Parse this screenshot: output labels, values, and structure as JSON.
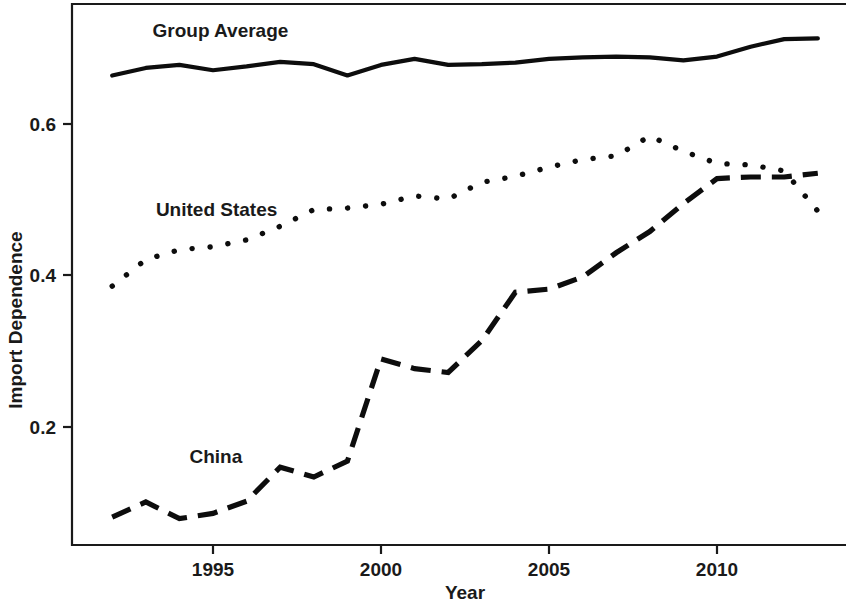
{
  "chart_data": {
    "type": "line",
    "title": "",
    "xlabel": "Year",
    "ylabel": "Import Dependence",
    "xlim": [
      1992,
      2013
    ],
    "ylim": [
      0.06,
      0.745
    ],
    "grid": false,
    "legend": "inline-labels",
    "x_ticks": [
      1995,
      2000,
      2005,
      2010
    ],
    "x_tick_labels": [
      "1995",
      "2000",
      "2005",
      "2010"
    ],
    "y_ticks": [
      0.2,
      0.4,
      0.6
    ],
    "y_tick_labels": [
      "0.2",
      "0.4",
      "0.6"
    ],
    "x": [
      1992,
      1993,
      1994,
      1995,
      1996,
      1997,
      1998,
      1999,
      2000,
      2001,
      2002,
      2003,
      2004,
      2005,
      2006,
      2007,
      2008,
      2009,
      2010,
      2011,
      2012,
      2013
    ],
    "series": [
      {
        "name": "Group Average",
        "line_style": "solid",
        "color": "#0d0d0d",
        "label_x": 1993.2,
        "label_y": 0.715,
        "values": [
          0.664,
          0.674,
          0.678,
          0.671,
          0.676,
          0.682,
          0.679,
          0.664,
          0.678,
          0.686,
          0.678,
          0.679,
          0.681,
          0.686,
          0.688,
          0.689,
          0.688,
          0.684,
          0.689,
          0.702,
          0.712,
          0.713
        ]
      },
      {
        "name": "United States",
        "line_style": "dotted",
        "color": "#0d0d0d",
        "label_x": 1993.3,
        "label_y": 0.478,
        "values": [
          0.386,
          0.421,
          0.434,
          0.438,
          0.447,
          0.465,
          0.487,
          0.489,
          0.494,
          0.505,
          0.501,
          0.523,
          0.531,
          0.543,
          0.553,
          0.558,
          0.584,
          0.564,
          0.548,
          0.546,
          0.538,
          0.485
        ]
      },
      {
        "name": "China",
        "line_style": "dashed",
        "color": "#0d0d0d",
        "label_x": 1994.3,
        "label_y": 0.152,
        "values": [
          0.081,
          0.101,
          0.079,
          0.086,
          0.102,
          0.147,
          0.134,
          0.155,
          0.29,
          0.277,
          0.272,
          0.314,
          0.378,
          0.382,
          0.398,
          0.43,
          0.458,
          0.495,
          0.528,
          0.53,
          0.53,
          0.535
        ]
      }
    ]
  },
  "axes": {
    "y_axis_title": "Import Dependence",
    "x_axis_title": "Year"
  }
}
